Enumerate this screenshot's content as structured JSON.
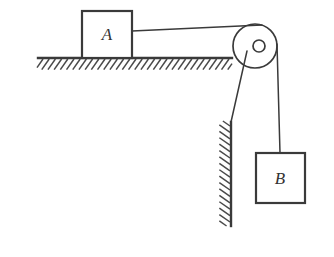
{
  "diagram": {
    "background_color": "#ffffff",
    "line_color": "#3a3a3a",
    "hatch_color": "#4a4a4a",
    "blocks": [
      {
        "id": "block-a",
        "label": "A",
        "x": 82,
        "y": 11,
        "width": 50,
        "height": 47,
        "label_x": 107,
        "label_y": 40
      },
      {
        "id": "block-b",
        "label": "B",
        "x": 256,
        "y": 153,
        "width": 49,
        "height": 50,
        "label_x": 280,
        "label_y": 184
      }
    ],
    "ground": {
      "id": "ground-surface",
      "x1": 38,
      "y1": 58,
      "x2": 232,
      "y2": 58,
      "hatch_length": 13,
      "hatch_spacing": 6.2,
      "hatch_angle": 55
    },
    "wall": {
      "id": "vertical-wall",
      "x": 231,
      "y_top": 122,
      "y_bottom": 226,
      "hatch_length": 13,
      "hatch_spacing": 6.4,
      "hatch_angle": 55
    },
    "pulley": {
      "id": "pulley-wheel",
      "cx": 255,
      "cy": 46,
      "outer_radius": 22,
      "axle_radius": 6
    },
    "ropes": [
      {
        "id": "rope-horizontal-a-to-pulley",
        "x1": 132,
        "y1": 31,
        "x2": 262,
        "y2": 25
      },
      {
        "id": "rope-vertical-pulley-to-b",
        "x1": 277,
        "y1": 44,
        "x2": 280,
        "y2": 153
      },
      {
        "id": "rope-diagonal-pulley-to-wall",
        "x1": 247,
        "y1": 51,
        "x2": 231,
        "y2": 122
      }
    ]
  }
}
